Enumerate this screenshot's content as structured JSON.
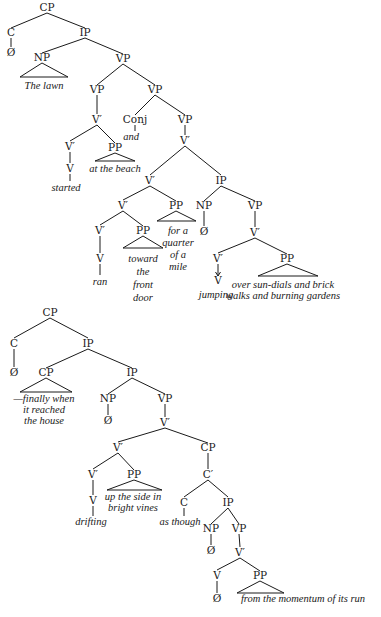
{
  "trees": [
    {
      "id": "tree-1",
      "nodes": [
        {
          "id": "n1",
          "label": "CP",
          "x": 47,
          "y": 11,
          "type": "cat"
        },
        {
          "id": "n2",
          "label": "C",
          "x": 11,
          "y": 36,
          "type": "cat"
        },
        {
          "id": "n3",
          "label": "Ø",
          "x": 11,
          "y": 56,
          "type": "cat"
        },
        {
          "id": "n4",
          "label": "IP",
          "x": 85,
          "y": 36,
          "type": "cat"
        },
        {
          "id": "n5",
          "label": "NP",
          "x": 42,
          "y": 61,
          "type": "cat"
        },
        {
          "id": "n6",
          "label": "The lawn",
          "x": 44,
          "y": 89,
          "type": "word"
        },
        {
          "id": "n7",
          "label": "VP",
          "x": 123,
          "y": 62,
          "type": "cat"
        },
        {
          "id": "n8",
          "label": "VP",
          "x": 97,
          "y": 93,
          "type": "cat"
        },
        {
          "id": "n9",
          "label": "VP",
          "x": 155,
          "y": 93,
          "type": "cat"
        },
        {
          "id": "n10",
          "label": "V′",
          "x": 97,
          "y": 123,
          "type": "cat"
        },
        {
          "id": "n11",
          "label": "Conj",
          "x": 135,
          "y": 123,
          "type": "cat"
        },
        {
          "id": "n12",
          "label": "and",
          "x": 131,
          "y": 140,
          "type": "word"
        },
        {
          "id": "n13",
          "label": "VP",
          "x": 185,
          "y": 123,
          "type": "cat"
        },
        {
          "id": "n14",
          "label": "V′",
          "x": 185,
          "y": 144,
          "type": "cat"
        },
        {
          "id": "n15",
          "label": "V′",
          "x": 70,
          "y": 150,
          "type": "cat"
        },
        {
          "id": "n16",
          "label": "PP",
          "x": 115,
          "y": 151,
          "type": "cat"
        },
        {
          "id": "n17",
          "label": "at the beach",
          "x": 115,
          "y": 172,
          "type": "word"
        },
        {
          "id": "n18",
          "label": "V",
          "x": 70,
          "y": 172,
          "type": "cat"
        },
        {
          "id": "n19",
          "label": "started",
          "x": 66,
          "y": 191,
          "type": "word"
        },
        {
          "id": "n20",
          "label": "V′",
          "x": 150,
          "y": 184,
          "type": "cat"
        },
        {
          "id": "n21",
          "label": "IP",
          "x": 221,
          "y": 184,
          "type": "cat"
        },
        {
          "id": "n22",
          "label": "V′",
          "x": 123,
          "y": 209,
          "type": "cat"
        },
        {
          "id": "n23",
          "label": "PP",
          "x": 176,
          "y": 209,
          "type": "cat"
        },
        {
          "id": "n24",
          "label": "NP",
          "x": 204,
          "y": 209,
          "type": "cat"
        },
        {
          "id": "n25",
          "label": "VP",
          "x": 255,
          "y": 209,
          "type": "cat"
        },
        {
          "id": "n26",
          "label": "V′",
          "x": 100,
          "y": 234,
          "type": "cat"
        },
        {
          "id": "n27",
          "label": "PP",
          "x": 143,
          "y": 234,
          "type": "cat"
        },
        {
          "id": "n28",
          "label": "Ø",
          "x": 204,
          "y": 235,
          "type": "cat"
        },
        {
          "id": "n29",
          "label": "V′",
          "x": 255,
          "y": 236,
          "type": "cat"
        },
        {
          "id": "n30",
          "label": "V",
          "x": 100,
          "y": 262,
          "type": "cat"
        },
        {
          "id": "n31",
          "label": "ran",
          "x": 100,
          "y": 285,
          "type": "word"
        },
        {
          "id": "n32",
          "label": "V′",
          "x": 218,
          "y": 262,
          "type": "cat"
        },
        {
          "id": "n33",
          "label": "PP",
          "x": 287,
          "y": 262,
          "type": "cat"
        },
        {
          "id": "n34",
          "label": "V",
          "x": 218,
          "y": 284,
          "type": "cat"
        },
        {
          "id": "n35",
          "label": "jumping",
          "x": 216,
          "y": 298,
          "type": "word"
        }
      ],
      "multiline_words": [
        {
          "id": "w1",
          "lines": [
            "toward",
            "the",
            "front",
            "door"
          ],
          "x": 143,
          "y": 262,
          "dy": 13
        },
        {
          "id": "w2",
          "lines": [
            "for a",
            "quarter",
            "of a",
            "mile"
          ],
          "x": 178,
          "y": 234,
          "dy": 12
        },
        {
          "id": "w3",
          "lines": [
            "over sun-dials and brick",
            "walks and burning gardens"
          ],
          "x": 283,
          "y": 288,
          "dy": 11
        }
      ]
    },
    {
      "id": "tree-2",
      "nodes": [
        {
          "id": "m1",
          "label": "CP",
          "x": 50,
          "y": 316,
          "type": "cat"
        },
        {
          "id": "m2",
          "label": "C",
          "x": 14,
          "y": 347,
          "type": "cat"
        },
        {
          "id": "m3",
          "label": "IP",
          "x": 88,
          "y": 347,
          "type": "cat"
        },
        {
          "id": "m4",
          "label": "Ø",
          "x": 14,
          "y": 376,
          "type": "cat"
        },
        {
          "id": "m5",
          "label": "CP",
          "x": 46,
          "y": 376,
          "type": "cat"
        },
        {
          "id": "m6",
          "label": "IP",
          "x": 132,
          "y": 376,
          "type": "cat"
        },
        {
          "id": "m7",
          "label": "NP",
          "x": 108,
          "y": 402,
          "type": "cat"
        },
        {
          "id": "m8",
          "label": "VP",
          "x": 165,
          "y": 402,
          "type": "cat"
        },
        {
          "id": "m9",
          "label": "Ø",
          "x": 108,
          "y": 424,
          "type": "cat"
        },
        {
          "id": "m10",
          "label": "V′",
          "x": 165,
          "y": 426,
          "type": "cat"
        },
        {
          "id": "m11",
          "label": "V′",
          "x": 118,
          "y": 451,
          "type": "cat"
        },
        {
          "id": "m12",
          "label": "CP",
          "x": 208,
          "y": 451,
          "type": "cat"
        },
        {
          "id": "m13",
          "label": "V′",
          "x": 93,
          "y": 478,
          "type": "cat"
        },
        {
          "id": "m14",
          "label": "PP",
          "x": 134,
          "y": 478,
          "type": "cat"
        },
        {
          "id": "m15",
          "label": "C′",
          "x": 208,
          "y": 478,
          "type": "cat"
        },
        {
          "id": "m16",
          "label": "V",
          "x": 93,
          "y": 504,
          "type": "cat"
        },
        {
          "id": "m17",
          "label": "drifting",
          "x": 91,
          "y": 525,
          "type": "word"
        },
        {
          "id": "m18",
          "label": "C",
          "x": 184,
          "y": 506,
          "type": "cat"
        },
        {
          "id": "m19",
          "label": "IP",
          "x": 228,
          "y": 506,
          "type": "cat"
        },
        {
          "id": "m20",
          "label": "as though",
          "x": 180,
          "y": 525,
          "type": "word"
        },
        {
          "id": "m21",
          "label": "NP",
          "x": 211,
          "y": 532,
          "type": "cat"
        },
        {
          "id": "m22",
          "label": "VP",
          "x": 239,
          "y": 532,
          "type": "cat"
        },
        {
          "id": "m23",
          "label": "Ø",
          "x": 211,
          "y": 554,
          "type": "cat"
        },
        {
          "id": "m24",
          "label": "V′",
          "x": 240,
          "y": 556,
          "type": "cat"
        },
        {
          "id": "m25",
          "label": "V",
          "x": 217,
          "y": 579,
          "type": "cat"
        },
        {
          "id": "m26",
          "label": "PP",
          "x": 260,
          "y": 579,
          "type": "cat"
        },
        {
          "id": "m27",
          "label": "Ø",
          "x": 217,
          "y": 602,
          "type": "cat"
        },
        {
          "id": "m28",
          "label": "from the momentum of its run",
          "x": 303,
          "y": 602,
          "type": "word"
        }
      ],
      "multiline_words": [
        {
          "id": "w4",
          "lines": [
            "—finally when",
            "it reached",
            "the house"
          ],
          "x": 44,
          "y": 402,
          "dy": 11
        },
        {
          "id": "w5",
          "lines": [
            "up the side in",
            "bright vines"
          ],
          "x": 133,
          "y": 500,
          "dy": 11
        }
      ]
    }
  ],
  "edges": [
    [
      47,
      13,
      11,
      28
    ],
    [
      47,
      13,
      85,
      28
    ],
    [
      11,
      38,
      11,
      47
    ],
    [
      85,
      38,
      42,
      53
    ],
    [
      85,
      38,
      123,
      54
    ],
    [
      123,
      64,
      97,
      85
    ],
    [
      123,
      64,
      155,
      85
    ],
    [
      97,
      95,
      97,
      114
    ],
    [
      155,
      95,
      135,
      115
    ],
    [
      155,
      95,
      185,
      115
    ],
    [
      135,
      125,
      135,
      131
    ],
    [
      185,
      125,
      185,
      135
    ],
    [
      97,
      125,
      70,
      141
    ],
    [
      97,
      125,
      115,
      143
    ],
    [
      70,
      152,
      70,
      163
    ],
    [
      70,
      174,
      70,
      181
    ],
    [
      185,
      146,
      150,
      175
    ],
    [
      185,
      146,
      221,
      175
    ],
    [
      150,
      186,
      123,
      200
    ],
    [
      150,
      186,
      176,
      201
    ],
    [
      221,
      186,
      204,
      201
    ],
    [
      221,
      186,
      255,
      201
    ],
    [
      123,
      211,
      100,
      225
    ],
    [
      123,
      211,
      143,
      226
    ],
    [
      100,
      236,
      100,
      253
    ],
    [
      100,
      264,
      100,
      275
    ],
    [
      204,
      211,
      204,
      226
    ],
    [
      255,
      211,
      255,
      227
    ],
    [
      255,
      238,
      218,
      253
    ],
    [
      255,
      238,
      287,
      254
    ],
    [
      50,
      318,
      14,
      338
    ],
    [
      50,
      318,
      88,
      338
    ],
    [
      14,
      349,
      14,
      367
    ],
    [
      88,
      349,
      46,
      368
    ],
    [
      88,
      349,
      132,
      368
    ],
    [
      132,
      378,
      108,
      394
    ],
    [
      132,
      378,
      165,
      394
    ],
    [
      108,
      404,
      108,
      415
    ],
    [
      165,
      404,
      165,
      417
    ],
    [
      165,
      428,
      118,
      442
    ],
    [
      165,
      428,
      208,
      443
    ],
    [
      118,
      453,
      93,
      469
    ],
    [
      118,
      453,
      134,
      470
    ],
    [
      208,
      453,
      208,
      469
    ],
    [
      93,
      480,
      93,
      495
    ],
    [
      93,
      506,
      93,
      516
    ],
    [
      208,
      480,
      184,
      497
    ],
    [
      208,
      480,
      228,
      497
    ],
    [
      184,
      508,
      184,
      516
    ],
    [
      228,
      508,
      211,
      524
    ],
    [
      228,
      508,
      239,
      524
    ],
    [
      211,
      534,
      211,
      545
    ],
    [
      239,
      534,
      240,
      547
    ],
    [
      240,
      558,
      217,
      570
    ],
    [
      240,
      558,
      260,
      571
    ],
    [
      217,
      581,
      217,
      593
    ]
  ],
  "arrows": [
    [
      218,
      264,
      218,
      276
    ]
  ],
  "triangles": [
    [
      42,
      63,
      20,
      77,
      68,
      77
    ],
    [
      115,
      153,
      95,
      161,
      135,
      161
    ],
    [
      176,
      211,
      157,
      221,
      196,
      221
    ],
    [
      143,
      236,
      123,
      248,
      163,
      248
    ],
    [
      287,
      264,
      258,
      276,
      318,
      276
    ],
    [
      46,
      378,
      20,
      392,
      72,
      392
    ],
    [
      134,
      480,
      107,
      490,
      162,
      490
    ],
    [
      260,
      581,
      237,
      593,
      284,
      593
    ]
  ]
}
